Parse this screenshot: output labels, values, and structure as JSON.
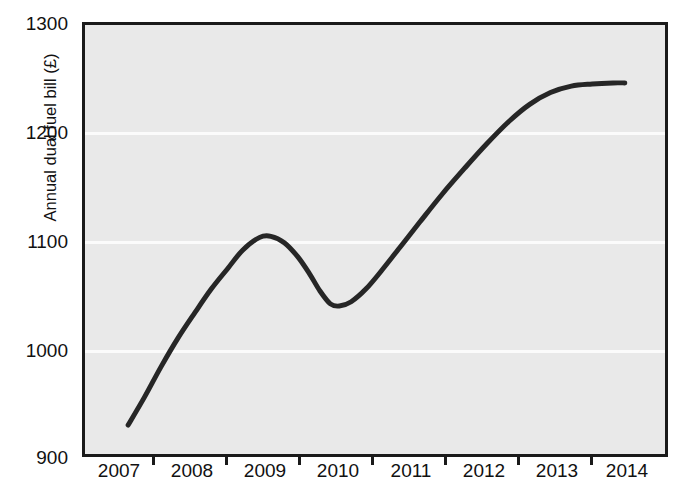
{
  "figure": {
    "title_fragment": "",
    "background_color": "#ffffff",
    "plot_background_color": "#e9e9e9",
    "gridline_color": "#fbfbfb",
    "axis_color": "#1a1a1a",
    "series_color": "#262626"
  },
  "chart_data": {
    "type": "line",
    "title": "",
    "xlabel": "",
    "ylabel": "Annual dual fuel bill (£)",
    "x": [
      2007,
      2008,
      2009,
      2010,
      2011,
      2012,
      2013,
      2014
    ],
    "categories": [
      "2007",
      "2008",
      "2009",
      "2010",
      "2011",
      "2012",
      "2013",
      "2014"
    ],
    "values": [
      927,
      1035,
      1103,
      1038,
      1120,
      1200,
      1240,
      1245
    ],
    "series": [
      {
        "name": "Annual dual fuel bill",
        "values": [
          927,
          1035,
          1103,
          1038,
          1120,
          1200,
          1240,
          1245
        ],
        "color": "#262626",
        "line_width": 5,
        "smoothed": true
      }
    ],
    "xlim": [
      2006.6,
      2014.4
    ],
    "ylim": [
      900,
      1300
    ],
    "xticks": [
      2007,
      2008,
      2009,
      2010,
      2011,
      2012,
      2013,
      2014
    ],
    "xtick_labels": [
      "2007",
      "2008",
      "2009",
      "2010",
      "2011",
      "2012",
      "2013",
      "2014"
    ],
    "yticks": [
      900,
      1000,
      1100,
      1200,
      1300
    ],
    "ytick_labels": [
      "900",
      "1000",
      "1100",
      "1200",
      "1300"
    ],
    "gridlines_y": [
      1000,
      1100,
      1200
    ],
    "grid": true,
    "legend": false,
    "legend_position": "none",
    "annotations": [],
    "notable_points": {
      "start": {
        "x": 2007.2,
        "y": 927
      },
      "local_maximum": {
        "x": 2008.95,
        "y": 1103
      },
      "local_minimum": {
        "x": 2009.9,
        "y": 1038
      },
      "end": {
        "x": 2013.85,
        "y": 1245
      }
    },
    "curve_path_points": [
      [
        2007.18,
        927
      ],
      [
        2007.4,
        953
      ],
      [
        2007.62,
        981
      ],
      [
        2007.85,
        1008
      ],
      [
        2008.08,
        1032
      ],
      [
        2008.3,
        1054
      ],
      [
        2008.52,
        1073
      ],
      [
        2008.72,
        1090
      ],
      [
        2008.95,
        1102
      ],
      [
        2009.1,
        1103
      ],
      [
        2009.28,
        1097
      ],
      [
        2009.46,
        1084
      ],
      [
        2009.62,
        1068
      ],
      [
        2009.76,
        1052
      ],
      [
        2009.9,
        1040
      ],
      [
        2010.02,
        1038
      ],
      [
        2010.18,
        1042
      ],
      [
        2010.38,
        1054
      ],
      [
        2010.6,
        1072
      ],
      [
        2010.85,
        1094
      ],
      [
        2011.1,
        1116
      ],
      [
        2011.4,
        1142
      ],
      [
        2011.7,
        1166
      ],
      [
        2012.0,
        1189
      ],
      [
        2012.3,
        1210
      ],
      [
        2012.58,
        1226
      ],
      [
        2012.86,
        1237
      ],
      [
        2013.14,
        1243
      ],
      [
        2013.42,
        1245
      ],
      [
        2013.7,
        1246
      ],
      [
        2013.86,
        1246
      ]
    ]
  },
  "axes": {
    "y_tick_labels": [
      "1300",
      "1200",
      "1100",
      "1000",
      "900"
    ],
    "x_tick_labels": [
      "2007",
      "2008",
      "2009",
      "2010",
      "2011",
      "2012",
      "2013",
      "2014"
    ]
  }
}
